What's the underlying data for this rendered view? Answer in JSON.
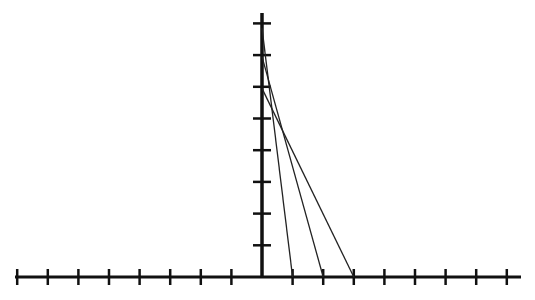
{
  "diagram": {
    "x_axis": {
      "min_tick": -8,
      "max_tick": 8,
      "tick_step": 1
    },
    "y_axis": {
      "min_tick": 1,
      "max_tick": 8,
      "tick_step": 1
    },
    "segments": [
      {
        "from": [
          0,
          7.85
        ],
        "to": [
          1,
          0
        ]
      },
      {
        "from": [
          0,
          6.95
        ],
        "to": [
          2,
          0
        ]
      },
      {
        "from": [
          0,
          5.95
        ],
        "to": [
          3,
          0
        ]
      }
    ],
    "colors": {
      "axis": "#111111",
      "line": "#222222",
      "background": "#ffffff"
    }
  }
}
